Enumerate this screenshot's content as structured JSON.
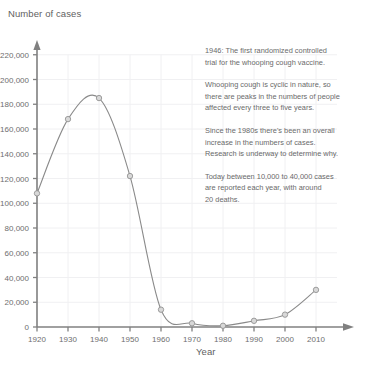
{
  "chart_data": {
    "type": "line",
    "title": "",
    "ylabel": "Number of cases",
    "xlabel": "Year",
    "x": [
      1920,
      1930,
      1940,
      1950,
      1960,
      1970,
      1980,
      1990,
      2000,
      2010
    ],
    "values": [
      108000,
      168000,
      185000,
      122000,
      14000,
      3000,
      1000,
      5000,
      10000,
      30000
    ],
    "series": [
      {
        "name": "Number of cases",
        "values": [
          108000,
          168000,
          185000,
          122000,
          14000,
          3000,
          1000,
          5000,
          10000,
          30000
        ]
      }
    ],
    "xlim": [
      1920,
      2010
    ],
    "ylim": [
      0,
      220000
    ],
    "x_tick_labels": [
      "1920",
      "1930",
      "1940",
      "1950",
      "1960",
      "1970",
      "1980",
      "1990",
      "2000",
      "2010"
    ],
    "y_tick_labels": [
      "0",
      "20,000",
      "40,000",
      "60,000",
      "80,000",
      "100,000",
      "120,000",
      "140,000",
      "160,000",
      "180,000",
      "200,000",
      "220,000"
    ],
    "y_tick_values": [
      0,
      20000,
      40000,
      60000,
      80000,
      100000,
      120000,
      140000,
      160000,
      180000,
      200000,
      220000
    ],
    "grid": true,
    "legend": "none",
    "line_color": "#8a8a8a",
    "marker_color": "#d8d8d8",
    "axis_color": "#808080",
    "grid_color": "#f0f0f2",
    "text_color": "#6b6b6b",
    "annotations": [
      "1946: The first randomized controlled\ntrial for the whooping cough vaccine.",
      "Whooping cough is cyclic in nature, so\nthere are peaks in the numbers of people\naffected every three to five years.",
      "Since the 1980s there's been an overall\nincrease in the numbers of cases.\nResearch is underway to determine why.",
      "Today between 10,000 to 40,000 cases\nare reported each year, with around\n20 deaths."
    ]
  }
}
